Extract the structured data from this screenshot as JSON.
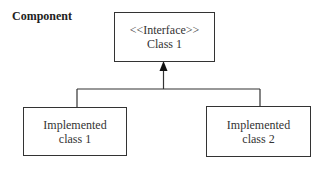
{
  "diagram": {
    "title": "Component",
    "interface_box": {
      "stereotype": "<<Interface>>",
      "name": "Class 1"
    },
    "implementations": [
      {
        "line1": "Implemented",
        "line2": "class 1"
      },
      {
        "line1": "Implemented",
        "line2": "class 2"
      }
    ],
    "relationship": "realization (arrow from implementations to interface)",
    "colors": {
      "line": "#333333",
      "background": "#ffffff"
    }
  }
}
